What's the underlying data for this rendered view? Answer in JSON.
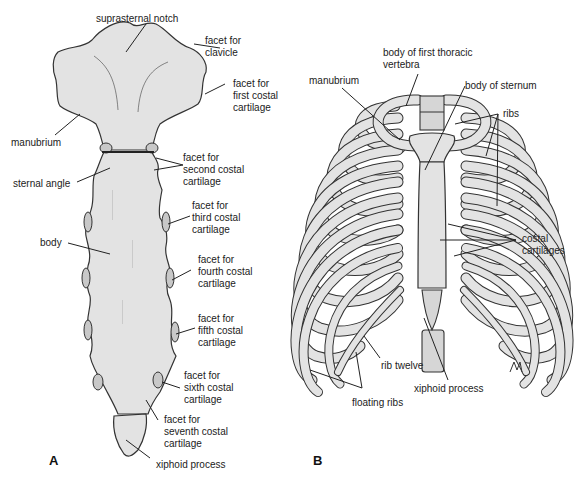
{
  "figure": {
    "panel_a": {
      "letter": "A",
      "subject": "sternum-anterior-view",
      "labels": {
        "suprasternal_notch": "suprasternal notch",
        "facet_clavicle": "facet for\nclavicle",
        "facet_first": "facet for\nfirst costal\ncartilage",
        "manubrium": "manubrium",
        "facet_second": "facet for\nsecond costal\ncartilage",
        "sternal_angle": "sternal angle",
        "facet_third": "facet for\nthird costal\ncartilage",
        "body": "body",
        "facet_fourth": "facet for\nfourth costal\ncartilage",
        "facet_fifth": "facet for\nfifth costal\ncartilage",
        "facet_sixth": "facet for\nsixth costal\ncartilage",
        "facet_seventh": "facet for\nseventh costal\ncartilage",
        "xiphoid_process": "xiphoid process"
      }
    },
    "panel_b": {
      "letter": "B",
      "subject": "thoracic-cage-anterior-view",
      "labels": {
        "body_first_thoracic": "body of first thoracic\nvertebra",
        "manubrium": "manubrium",
        "body_of_sternum": "body of sternum",
        "ribs": "ribs",
        "costal_cartilages": "costal\ncartilages",
        "rib_twelve": "rib twelve",
        "xiphoid_process": "xiphoid process",
        "floating_ribs": "floating ribs"
      }
    },
    "colors": {
      "bone": "#e3e3e3",
      "cartilage": "#c8c8c8",
      "outline": "#333333",
      "text": "#222222",
      "background": "#ffffff"
    }
  }
}
